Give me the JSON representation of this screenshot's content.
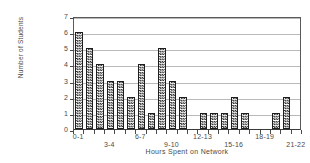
{
  "chart_data": {
    "type": "bar",
    "title": "",
    "xlabel": "Hours Spent on Network",
    "ylabel": "Number of Students",
    "categories": [
      "0-1",
      "1-2",
      "2-3",
      "3-4",
      "4-5",
      "5-6",
      "6-7",
      "7-8",
      "8-9",
      "9-10",
      "10-11",
      "11-12",
      "12-13",
      "13-14",
      "14-15",
      "15-16",
      "16-17",
      "17-18",
      "18-19",
      "19-20",
      "20-21",
      "21-22"
    ],
    "values": [
      6,
      5,
      4,
      3,
      3,
      2,
      4,
      1,
      5,
      3,
      2,
      0,
      1,
      1,
      1,
      2,
      1,
      0,
      0,
      1,
      2,
      0
    ],
    "ylim": [
      0,
      7
    ],
    "yticks": [
      0,
      1,
      2,
      3,
      4,
      5,
      6,
      7
    ],
    "xtick_labels": [
      "0-1",
      "3-4",
      "6-7",
      "9-10",
      "12-13",
      "15-16",
      "18-19",
      "21-22"
    ],
    "xtick_label_bins": [
      0,
      3,
      6,
      9,
      12,
      15,
      18,
      21
    ],
    "xtick_label_rows": [
      0,
      1,
      0,
      1,
      0,
      1,
      0,
      1
    ],
    "grid": true,
    "legend": "none",
    "bar_fill": "checkerboard-hatch",
    "bar_color": "#2b2b2b"
  }
}
